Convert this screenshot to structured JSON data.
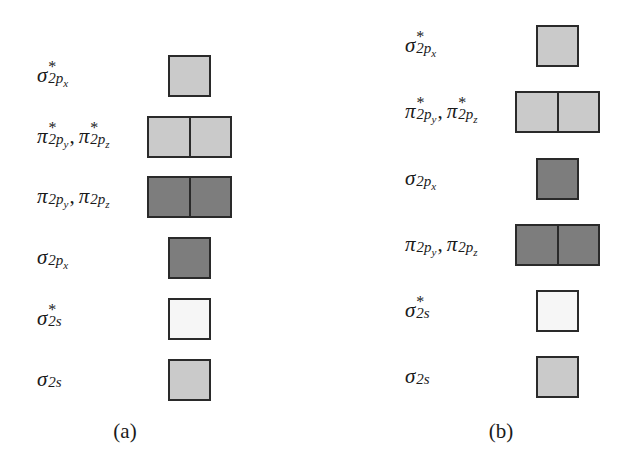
{
  "colors": {
    "light": "#cacaca",
    "dark": "#7d7d7d",
    "white": "#f6f6f6",
    "border": "#2a2a2a"
  },
  "panels": [
    {
      "caption": "(a)",
      "rows": [
        {
          "symbol": "σ",
          "star": "*",
          "sub": "2p",
          "subsub": "x",
          "symbol2": null,
          "fill": "light",
          "cells": 1
        },
        {
          "symbol": "π",
          "star": "*",
          "sub": "2p",
          "subsub": "y",
          "symbol2": "π",
          "star2": "*",
          "sub2": "2p",
          "subsub2": "z",
          "fill": "light",
          "cells": 2
        },
        {
          "symbol": "π",
          "star": "",
          "sub": "2p",
          "subsub": "y",
          "symbol2": "π",
          "star2": "",
          "sub2": "2p",
          "subsub2": "z",
          "fill": "dark",
          "cells": 2
        },
        {
          "symbol": "σ",
          "star": "",
          "sub": "2p",
          "subsub": "x",
          "symbol2": null,
          "fill": "dark",
          "cells": 1
        },
        {
          "symbol": "σ",
          "star": "*",
          "sub": "2s",
          "subsub": "",
          "symbol2": null,
          "fill": "white",
          "cells": 1
        },
        {
          "symbol": "σ",
          "star": "",
          "sub": "2s",
          "subsub": "",
          "symbol2": null,
          "fill": "light",
          "cells": 1
        }
      ]
    },
    {
      "caption": "(b)",
      "rows": [
        {
          "symbol": "σ",
          "star": "*",
          "sub": "2p",
          "subsub": "x",
          "symbol2": null,
          "fill": "light",
          "cells": 1
        },
        {
          "symbol": "π",
          "star": "*",
          "sub": "2p",
          "subsub": "y",
          "symbol2": "π",
          "star2": "*",
          "sub2": "2p",
          "subsub2": "z",
          "fill": "light",
          "cells": 2
        },
        {
          "symbol": "σ",
          "star": "",
          "sub": "2p",
          "subsub": "x",
          "symbol2": null,
          "fill": "dark",
          "cells": 1
        },
        {
          "symbol": "π",
          "star": "",
          "sub": "2p",
          "subsub": "y",
          "symbol2": "π",
          "star2": "",
          "sub2": "2p",
          "subsub2": "z",
          "fill": "dark",
          "cells": 2
        },
        {
          "symbol": "σ",
          "star": "*",
          "sub": "2s",
          "subsub": "",
          "symbol2": null,
          "fill": "white",
          "cells": 1
        },
        {
          "symbol": "σ",
          "star": "",
          "sub": "2s",
          "subsub": "",
          "symbol2": null,
          "fill": "light",
          "cells": 1
        }
      ]
    }
  ]
}
